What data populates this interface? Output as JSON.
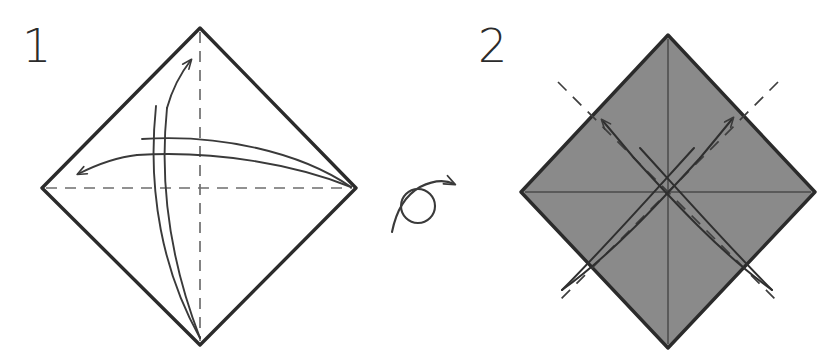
{
  "document": {
    "title": "Origami folding diagram",
    "background_color": "#ffffff",
    "width": 821,
    "height": 353
  },
  "palette": {
    "paper_white": "#ffffff",
    "paper_gray": "#8a8a8a",
    "edge_stroke": "#2b2b2b",
    "crease_dashed": "#6e6e6e",
    "crease_solid": "#4a4a4a",
    "arrow_stroke": "#3a3a3a",
    "number_color": "#2b2b2b"
  },
  "steps": [
    {
      "id": "step-1",
      "number": "1",
      "number_position": {
        "x": 22,
        "y": 62
      },
      "paper": {
        "name": "square-rotated-diamond",
        "fill": "#ffffff",
        "side_shown": "white",
        "vertices": {
          "top": {
            "x": 200,
            "y": 28
          },
          "right": {
            "x": 356,
            "y": 188
          },
          "bottom": {
            "x": 200,
            "y": 345
          },
          "left": {
            "x": 42,
            "y": 188
          }
        }
      },
      "creases": [
        {
          "name": "vertical-center-crease",
          "style": "dashed",
          "from": {
            "x": 200,
            "y": 28
          },
          "to": {
            "x": 200,
            "y": 345
          }
        },
        {
          "name": "horizontal-center-crease",
          "style": "dashed",
          "from": {
            "x": 42,
            "y": 188
          },
          "to": {
            "x": 356,
            "y": 188
          }
        }
      ],
      "arrows": [
        {
          "name": "fold-arrow-up",
          "direction": "up",
          "tip": {
            "x": 190,
            "y": 57
          },
          "tail": {
            "x": 200,
            "y": 340
          }
        },
        {
          "name": "fold-arrow-left",
          "direction": "left",
          "tip": {
            "x": 73,
            "y": 175
          },
          "tail": {
            "x": 352,
            "y": 186
          }
        }
      ]
    },
    {
      "id": "step-2",
      "number": "2",
      "number_position": {
        "x": 478,
        "y": 62
      },
      "paper": {
        "name": "square-rotated-diamond",
        "fill": "#8a8a8a",
        "side_shown": "colored",
        "vertices": {
          "top": {
            "x": 668,
            "y": 35
          },
          "right": {
            "x": 815,
            "y": 192
          },
          "bottom": {
            "x": 668,
            "y": 348
          },
          "left": {
            "x": 521,
            "y": 192
          }
        }
      },
      "creases": [
        {
          "name": "vertical-center-crease",
          "style": "solid",
          "from": {
            "x": 668,
            "y": 35
          },
          "to": {
            "x": 668,
            "y": 348
          }
        },
        {
          "name": "horizontal-center-crease",
          "style": "solid",
          "from": {
            "x": 521,
            "y": 192
          },
          "to": {
            "x": 815,
            "y": 192
          }
        },
        {
          "name": "diagonal-crease-nw-se",
          "style": "dashed",
          "from": {
            "x": 560,
            "y": 84
          },
          "to": {
            "x": 776,
            "y": 300
          }
        },
        {
          "name": "diagonal-crease-ne-sw",
          "style": "dashed",
          "from": {
            "x": 776,
            "y": 84
          },
          "to": {
            "x": 560,
            "y": 300
          }
        }
      ],
      "arrows": [
        {
          "name": "fold-arrow-upper-left",
          "direction": "upper-left",
          "tip": {
            "x": 596,
            "y": 112
          },
          "tail": {
            "x": 772,
            "y": 290
          }
        },
        {
          "name": "fold-arrow-upper-right",
          "direction": "upper-right",
          "tip": {
            "x": 738,
            "y": 110
          },
          "tail": {
            "x": 562,
            "y": 290
          }
        }
      ]
    }
  ],
  "symbols": [
    {
      "name": "turn-over-symbol",
      "meaning": "turn the model over",
      "loop_center": {
        "x": 418,
        "y": 206
      },
      "loop_radius": 17,
      "arrow_tip": {
        "x": 457,
        "y": 182
      }
    }
  ]
}
